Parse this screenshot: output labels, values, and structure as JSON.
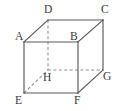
{
  "figure": {
    "kind": "cube-diagram",
    "background_color": "#ffffff",
    "solid_edge_color": "#58585a",
    "hidden_edge_color": "#8d8d90",
    "label_color": "#3a3a3c",
    "vertices": [
      {
        "id": "A",
        "label": "A",
        "x": 24,
        "y": 42,
        "label_x": 15,
        "label_y": 40,
        "hidden": false,
        "face": "front-top-left"
      },
      {
        "id": "B",
        "label": "B",
        "x": 78,
        "y": 42,
        "label_x": 70,
        "label_y": 40,
        "hidden": false,
        "face": "front-top-right"
      },
      {
        "id": "C",
        "label": "C",
        "x": 103,
        "y": 20,
        "label_x": 101,
        "label_y": 13,
        "hidden": false,
        "face": "back-top-right"
      },
      {
        "id": "D",
        "label": "D",
        "x": 48,
        "y": 20,
        "label_x": 44,
        "label_y": 13,
        "hidden": false,
        "face": "back-top-left"
      },
      {
        "id": "E",
        "label": "E",
        "x": 24,
        "y": 93,
        "label_x": 15,
        "label_y": 104,
        "hidden": false,
        "face": "front-bottom-left"
      },
      {
        "id": "F",
        "label": "F",
        "x": 78,
        "y": 93,
        "label_x": 74,
        "label_y": 104,
        "hidden": false,
        "face": "front-bottom-right"
      },
      {
        "id": "G",
        "label": "G",
        "x": 103,
        "y": 70,
        "label_x": 103,
        "label_y": 80,
        "hidden": false,
        "face": "back-bottom-right"
      },
      {
        "id": "H",
        "label": "H",
        "x": 48,
        "y": 70,
        "label_x": 43,
        "label_y": 81,
        "hidden": true,
        "face": "back-bottom-left"
      }
    ],
    "edges": [
      {
        "from": "A",
        "to": "B",
        "style": "solid"
      },
      {
        "from": "B",
        "to": "F",
        "style": "solid"
      },
      {
        "from": "F",
        "to": "E",
        "style": "solid"
      },
      {
        "from": "E",
        "to": "A",
        "style": "solid"
      },
      {
        "from": "D",
        "to": "C",
        "style": "solid"
      },
      {
        "from": "C",
        "to": "G",
        "style": "solid"
      },
      {
        "from": "A",
        "to": "D",
        "style": "solid"
      },
      {
        "from": "B",
        "to": "C",
        "style": "solid"
      },
      {
        "from": "F",
        "to": "G",
        "style": "solid"
      },
      {
        "from": "D",
        "to": "H",
        "style": "dashed"
      },
      {
        "from": "H",
        "to": "G",
        "style": "dashed"
      },
      {
        "from": "E",
        "to": "H",
        "style": "dashed"
      }
    ]
  }
}
